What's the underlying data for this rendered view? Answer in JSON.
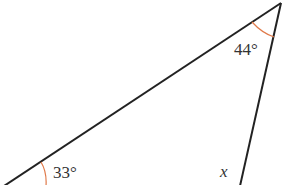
{
  "diagram": {
    "type": "triangle",
    "colors": {
      "line": "#222222",
      "arc": "#e07a4a",
      "text": "#333333"
    },
    "vertices": {
      "top_right": [
        281,
        3
      ],
      "bottom_left": [
        4,
        186
      ],
      "bottom_right": [
        240,
        186
      ]
    },
    "angles": [
      {
        "vertex": "top_right",
        "label": "44°"
      },
      {
        "vertex": "bottom_left",
        "label": "33°"
      },
      {
        "vertex": "bottom_right",
        "label": "x"
      }
    ]
  }
}
